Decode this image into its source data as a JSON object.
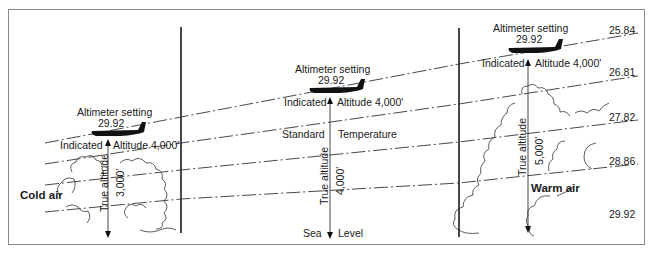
{
  "diagram": {
    "panels": [
      {
        "id": "cold",
        "altimeter_setting_label": "Altimeter setting",
        "altimeter_setting_value": "29.92",
        "indicated_left": "Indicated",
        "indicated_right": "Altitude 4,000'",
        "true_altitude_label": "True altitude",
        "true_altitude_value": "3,000'",
        "air_label": "Cold air"
      },
      {
        "id": "standard",
        "altimeter_setting_label": "Altimeter setting",
        "altimeter_setting_value": "29.92",
        "indicated_left": "Indicated",
        "indicated_right": "Altitude 4,000'",
        "true_altitude_label": "True altitude",
        "true_altitude_value": "4,000'",
        "standard_left": "Standard",
        "standard_right": "Temperature",
        "sea_left": "Sea",
        "sea_right": "Level"
      },
      {
        "id": "warm",
        "altimeter_setting_label": "Altimeter setting",
        "altimeter_setting_value": "29.92",
        "indicated_left": "Indicated",
        "indicated_right": "Altitude 4,000'",
        "true_altitude_label": "True altitude",
        "true_altitude_value": "5,000'",
        "air_label": "Warm air"
      }
    ],
    "pressure_levels": [
      "25.84",
      "26.81",
      "27.82",
      "28.86",
      "29.92"
    ],
    "colors": {
      "line": "#1a1a1a",
      "frame": "#8a8a8a",
      "background": "#ffffff"
    }
  }
}
